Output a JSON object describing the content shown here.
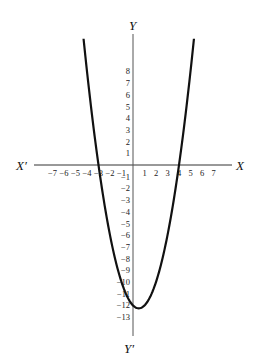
{
  "chart_data": {
    "type": "line",
    "title": "",
    "function": "y = x^2 - x - 12",
    "xlabel": "X",
    "xlabel_neg": "X′",
    "ylabel": "Y",
    "ylabel_neg": "Y′",
    "x_ticks": [
      -7,
      -6,
      -5,
      -4,
      -3,
      -2,
      -1,
      1,
      2,
      3,
      4,
      5,
      6,
      7
    ],
    "y_ticks": [
      8,
      7,
      6,
      5,
      4,
      3,
      2,
      1,
      -1,
      -2,
      -3,
      -4,
      -5,
      -6,
      -7,
      -8,
      -9,
      -10,
      -11,
      -12,
      -13
    ],
    "xlim": [
      -8.3,
      8.5
    ],
    "ylim": [
      -14.5,
      10.5
    ],
    "roots": [
      -3,
      4
    ],
    "y_intercept": -12,
    "vertex": [
      0.5,
      -12.25
    ],
    "series": [
      {
        "name": "parabola",
        "x": [
          -4.3,
          -4,
          -3,
          -2,
          -1,
          0,
          0.5,
          1,
          2,
          3,
          4,
          5,
          5.3
        ],
        "y": [
          10.79,
          8,
          0,
          -6,
          -10,
          -12,
          -12.25,
          -12,
          -10,
          -6,
          0,
          8,
          10.79
        ]
      }
    ],
    "grid": false,
    "legend": null
  }
}
